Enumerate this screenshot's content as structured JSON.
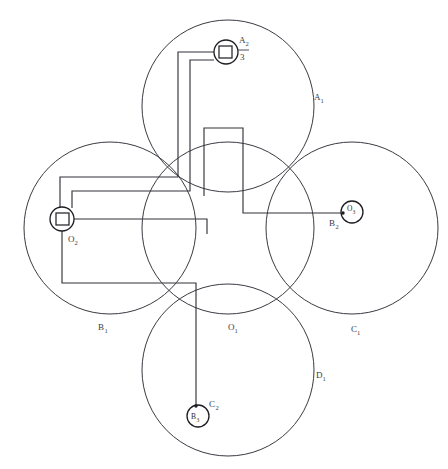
{
  "diagram": {
    "type": "geometric-schematic",
    "canvas": {
      "width": 448,
      "height": 469,
      "background": "#ffffff"
    },
    "stroke_color": "#33333b",
    "label_color": "#3b3b43",
    "big_circles": [
      {
        "id": "O1",
        "label": "O",
        "subscript": "1",
        "cx": 228,
        "cy": 228,
        "r": 86,
        "label_x": 231,
        "label_y": 331
      },
      {
        "id": "A1",
        "label": "A",
        "subscript": "1",
        "cx": 228,
        "cy": 106,
        "r": 86,
        "label_x": 316,
        "label_y": 100
      },
      {
        "id": "B1",
        "label": "B",
        "subscript": "1",
        "cx": 110,
        "cy": 228,
        "r": 86,
        "label_x": 100,
        "label_y": 330
      },
      {
        "id": "C1",
        "label": "C",
        "subscript": "1",
        "cx": 352,
        "cy": 228,
        "r": 86,
        "label_x": 353,
        "label_y": 332
      },
      {
        "id": "D1",
        "label": "D",
        "subscript": "1",
        "cx": 228,
        "cy": 370,
        "r": 86,
        "label_x": 318,
        "label_y": 378
      }
    ],
    "nodes": [
      {
        "id": "A2",
        "label": "A",
        "subscript": "2",
        "denominator": "3",
        "cx": 226,
        "cy": 52,
        "r": 12,
        "shape": "square-in-circle",
        "label_x": 241,
        "label_y": 44
      },
      {
        "id": "O2",
        "label": "O",
        "subscript": "2",
        "cx": 62,
        "cy": 219,
        "r": 12,
        "shape": "square-in-circle",
        "label_x": 70,
        "label_y": 243
      },
      {
        "id": "O3",
        "label": "O",
        "subscript": "3",
        "outer_label": "B",
        "outer_subscript": "2",
        "cx": 352,
        "cy": 212,
        "r": 11,
        "shape": "dot-in-circle",
        "label_x": 348,
        "label_y": 213,
        "outer_label_x": 332,
        "outer_label_y": 226
      },
      {
        "id": "B3",
        "label": "B",
        "subscript": "3",
        "outer_label": "C",
        "outer_subscript": "2",
        "cx": 198,
        "cy": 416,
        "r": 11,
        "shape": "dot-in-circle",
        "label_x": 194,
        "label_y": 419,
        "outer_label_x": 211,
        "outer_label_y": 408
      }
    ],
    "wires": [
      {
        "id": "wire-a2-left-outer",
        "from": "A2",
        "to": "O2",
        "points": "214,52 178,52 178,177 60,177 60,219"
      },
      {
        "id": "wire-a2-left-inner",
        "from": "A2",
        "to": "O2",
        "points": "214,58 190,58 190,190 70,190 70,205"
      },
      {
        "id": "wire-center-stub-up",
        "from": "O1",
        "to": "center",
        "points": "204,195 204,128 243,128 243,213 352,213"
      },
      {
        "id": "wire-o2-to-center-low",
        "from": "O2",
        "to": "bottom",
        "points": "74,219 207,219 207,228"
      },
      {
        "id": "wire-o2-bottom-loop",
        "from": "O2",
        "to": "B3",
        "points": "62,231 62,282 196,282 196,405"
      }
    ],
    "pointer_lines": [
      {
        "id": "pointer-o3",
        "points": "243,213 341,213"
      },
      {
        "id": "pointer-b3",
        "points": "198,290 198,405"
      }
    ]
  },
  "labels": {
    "O1": "O",
    "O1_sub": "1",
    "A1": "A",
    "A1_sub": "1",
    "B1": "B",
    "B1_sub": "1",
    "C1": "C",
    "C1_sub": "1",
    "D1": "D",
    "D1_sub": "1",
    "A2": "A",
    "A2_sub": "2",
    "A2_den": "3",
    "O2": "O",
    "O2_sub": "2",
    "O3": "O",
    "O3_sub": "3",
    "B2": "B",
    "B2_sub": "2",
    "B3": "B",
    "B3_sub": "3",
    "C2": "C",
    "C2_sub": "2"
  }
}
